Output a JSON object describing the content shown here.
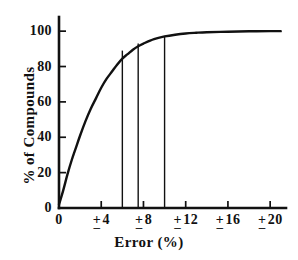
{
  "chart_data": {
    "type": "line",
    "title": "",
    "xlabel": "Error (%)",
    "ylabel": "% of Compounds",
    "xlim": [
      0,
      21.5
    ],
    "ylim": [
      0,
      108
    ],
    "grid": false,
    "legend": false,
    "x_tick_values": [
      0,
      4,
      8,
      12,
      16,
      20
    ],
    "x_tick_labels": [
      "0",
      "± 4",
      "± 8",
      "±12",
      "± 16",
      "± 20"
    ],
    "y_tick_values": [
      0,
      20,
      40,
      60,
      80,
      100
    ],
    "y_tick_labels": [
      "0",
      "20",
      "40",
      "60",
      "80",
      "100"
    ],
    "series": [
      {
        "name": "cumulative % of compounds",
        "x": [
          0,
          0.4,
          0.8,
          1.2,
          1.6,
          2.0,
          2.5,
          3.0,
          3.5,
          4.0,
          4.5,
          5.0,
          5.5,
          6.0,
          6.5,
          7.0,
          7.5,
          8.0,
          9.0,
          10.0,
          11.0,
          12.0,
          13.0,
          14.0,
          16.0,
          18.0,
          20.0,
          21.0
        ],
        "y": [
          2,
          10,
          19,
          27,
          34,
          41,
          49,
          56,
          62,
          68,
          73,
          77,
          81,
          84.5,
          87,
          89.5,
          91.5,
          93,
          95.5,
          97,
          98,
          98.7,
          99.1,
          99.4,
          99.7,
          99.9,
          100,
          100
        ]
      }
    ],
    "drop_lines": [
      {
        "x": 6.0,
        "y": 89
      },
      {
        "x": 7.5,
        "y": 93
      },
      {
        "x": 10.0,
        "y": 97
      }
    ]
  },
  "axes": {
    "x_title": "Error (%)",
    "y_title": "% of Compounds"
  },
  "tick_marks": {
    "x": [
      {
        "value": 0,
        "top": "",
        "bot": "",
        "label": "0"
      },
      {
        "value": 4,
        "top": "+",
        "bot": "–",
        "label": "4"
      },
      {
        "value": 8,
        "top": "+",
        "bot": "–",
        "label": "8"
      },
      {
        "value": 12,
        "top": "+",
        "bot": "–",
        "label": "12"
      },
      {
        "value": 16,
        "top": "+",
        "bot": "–",
        "label": "16"
      },
      {
        "value": 20,
        "top": "+",
        "bot": "–",
        "label": "20"
      }
    ],
    "y": [
      {
        "value": 0,
        "label": "0"
      },
      {
        "value": 20,
        "label": "20"
      },
      {
        "value": 40,
        "label": "40"
      },
      {
        "value": 60,
        "label": "60"
      },
      {
        "value": 80,
        "label": "80"
      },
      {
        "value": 100,
        "label": "100"
      }
    ]
  },
  "style": {
    "ink_color": "#111111",
    "background_color": "#ffffff"
  }
}
